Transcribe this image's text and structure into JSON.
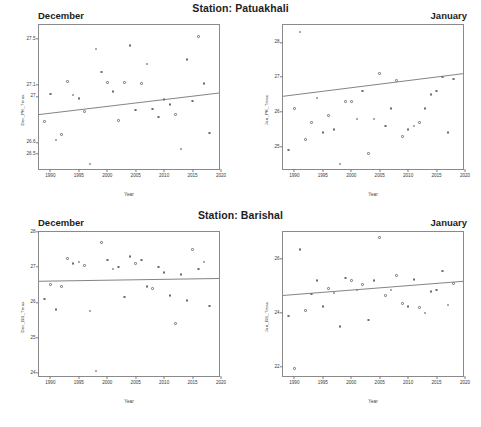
{
  "figure": {
    "width": 481,
    "height": 427,
    "point_color": "#6e6e78",
    "line_color": "#6b6b73",
    "frame_color": "#8a8a8a",
    "xlabel": "Year"
  },
  "stations": [
    {
      "title": "Station: Patuakhali",
      "panels": [
        {
          "panel_title": "December",
          "ylabel": "Dec_PK_Tmax",
          "yticks": [
            "26.5",
            "26.6",
            "27.0",
            "27.1",
            "27.5"
          ],
          "ytick_values": [
            26.5,
            26.6,
            27.0,
            27.1,
            27.5
          ],
          "xticks": [
            "1990",
            "1995",
            "2000",
            "2005",
            "2010",
            "2015",
            "2020"
          ]
        },
        {
          "panel_title": "January",
          "ylabel": "Jan_PK_Tmax",
          "yticks": [
            "25",
            "26",
            "27",
            "28"
          ],
          "ytick_values": [
            25,
            26,
            27,
            28
          ],
          "xticks": [
            "1990",
            "1995",
            "2000",
            "2005",
            "2010",
            "2015",
            "2020"
          ]
        }
      ]
    },
    {
      "title": "Station: Barishal",
      "panels": [
        {
          "panel_title": "December",
          "ylabel": "Dec_BS_Tmax",
          "yticks": [
            "24",
            "25",
            "26",
            "27",
            "28"
          ],
          "ytick_values": [
            24,
            25,
            26,
            27,
            28
          ],
          "xticks": [
            "1990",
            "1995",
            "2000",
            "2005",
            "2010",
            "2015",
            "2020"
          ]
        },
        {
          "panel_title": "January",
          "ylabel": "Jan_BS_Tmax",
          "yticks": [
            "22",
            "24",
            "26"
          ],
          "ytick_values": [
            22,
            24,
            26
          ],
          "xticks": [
            "1990",
            "1995",
            "2000",
            "2005",
            "2010",
            "2015",
            "2020"
          ]
        }
      ]
    }
  ],
  "chart_data": [
    {
      "type": "scatter",
      "title": "December",
      "panel_position": "top-left",
      "station": "Patuakhali",
      "month": "December",
      "xlabel": "Year",
      "ylabel": "Dec_PK_Tmax",
      "xlim": [
        1988,
        2020
      ],
      "ylim": [
        26.35,
        27.62
      ],
      "yticks": [
        26.5,
        26.6,
        27.0,
        27.1,
        27.5
      ],
      "xticks": [
        1990,
        1995,
        2000,
        2005,
        2010,
        2015,
        2020
      ],
      "grid": false,
      "legend": false,
      "points": [
        {
          "x": 1989,
          "y": 26.78
        },
        {
          "x": 1990,
          "y": 27.02
        },
        {
          "x": 1991,
          "y": 26.62
        },
        {
          "x": 1992,
          "y": 26.67
        },
        {
          "x": 1993,
          "y": 27.13
        },
        {
          "x": 1994,
          "y": 27.01
        },
        {
          "x": 1995,
          "y": 26.98
        },
        {
          "x": 1996,
          "y": 26.87
        },
        {
          "x": 1997,
          "y": 26.41
        },
        {
          "x": 1998,
          "y": 27.41
        },
        {
          "x": 1999,
          "y": 27.21
        },
        {
          "x": 2000,
          "y": 27.12
        },
        {
          "x": 2001,
          "y": 27.04
        },
        {
          "x": 2002,
          "y": 26.79
        },
        {
          "x": 2003,
          "y": 27.12
        },
        {
          "x": 2004,
          "y": 27.44
        },
        {
          "x": 2005,
          "y": 26.88
        },
        {
          "x": 2006,
          "y": 27.11
        },
        {
          "x": 2007,
          "y": 27.28
        },
        {
          "x": 2008,
          "y": 26.89
        },
        {
          "x": 2009,
          "y": 26.82
        },
        {
          "x": 2010,
          "y": 26.97
        },
        {
          "x": 2011,
          "y": 26.93
        },
        {
          "x": 2012,
          "y": 26.84
        },
        {
          "x": 2013,
          "y": 26.54
        },
        {
          "x": 2014,
          "y": 27.32
        },
        {
          "x": 2015,
          "y": 26.96
        },
        {
          "x": 2016,
          "y": 27.52
        },
        {
          "x": 2017,
          "y": 27.11
        },
        {
          "x": 2018,
          "y": 26.68
        }
      ],
      "trend_line": {
        "x": [
          1988,
          2020
        ],
        "y": [
          26.83,
          27.02
        ],
        "slope_per_year": 0.006
      }
    },
    {
      "type": "scatter",
      "title": "January",
      "panel_position": "top-right",
      "station": "Patuakhali",
      "month": "January",
      "xlabel": "Year",
      "ylabel": "Jan_PK_Tmax",
      "xlim": [
        1988,
        2020
      ],
      "ylim": [
        24.3,
        28.5
      ],
      "yticks": [
        25,
        26,
        27,
        28
      ],
      "xticks": [
        1990,
        1995,
        2000,
        2005,
        2010,
        2015,
        2020
      ],
      "grid": false,
      "legend": false,
      "points": [
        {
          "x": 1989,
          "y": 24.9
        },
        {
          "x": 1990,
          "y": 26.1
        },
        {
          "x": 1991,
          "y": 28.3
        },
        {
          "x": 1992,
          "y": 25.2
        },
        {
          "x": 1993,
          "y": 25.7
        },
        {
          "x": 1994,
          "y": 26.4
        },
        {
          "x": 1995,
          "y": 25.4
        },
        {
          "x": 1996,
          "y": 25.9
        },
        {
          "x": 1997,
          "y": 25.5
        },
        {
          "x": 1998,
          "y": 24.5
        },
        {
          "x": 1999,
          "y": 26.3
        },
        {
          "x": 2000,
          "y": 26.3
        },
        {
          "x": 2001,
          "y": 25.8
        },
        {
          "x": 2002,
          "y": 26.6
        },
        {
          "x": 2003,
          "y": 24.8
        },
        {
          "x": 2004,
          "y": 25.8
        },
        {
          "x": 2005,
          "y": 27.1
        },
        {
          "x": 2006,
          "y": 25.6
        },
        {
          "x": 2007,
          "y": 26.1
        },
        {
          "x": 2008,
          "y": 26.9
        },
        {
          "x": 2009,
          "y": 25.3
        },
        {
          "x": 2010,
          "y": 25.5
        },
        {
          "x": 2011,
          "y": 25.6
        },
        {
          "x": 2012,
          "y": 25.7
        },
        {
          "x": 2013,
          "y": 26.1
        },
        {
          "x": 2014,
          "y": 26.5
        },
        {
          "x": 2015,
          "y": 26.6
        },
        {
          "x": 2016,
          "y": 27.0
        },
        {
          "x": 2017,
          "y": 25.4
        },
        {
          "x": 2018,
          "y": 26.95
        }
      ],
      "trend_line": {
        "x": [
          1988,
          2020
        ],
        "y": [
          26.42,
          27.08
        ],
        "slope_per_year": 0.021
      }
    },
    {
      "type": "scatter",
      "title": "December",
      "panel_position": "bottom-left",
      "station": "Barishal",
      "month": "December",
      "xlabel": "Year",
      "ylabel": "Dec_BS_Tmax",
      "xlim": [
        1988,
        2020
      ],
      "ylim": [
        23.85,
        28.0
      ],
      "yticks": [
        24,
        25,
        26,
        27,
        28
      ],
      "xticks": [
        1990,
        1995,
        2000,
        2005,
        2010,
        2015,
        2020
      ],
      "grid": false,
      "legend": false,
      "points": [
        {
          "x": 1989,
          "y": 26.1
        },
        {
          "x": 1990,
          "y": 26.5
        },
        {
          "x": 1991,
          "y": 25.8
        },
        {
          "x": 1992,
          "y": 26.45
        },
        {
          "x": 1993,
          "y": 27.25
        },
        {
          "x": 1994,
          "y": 27.1
        },
        {
          "x": 1995,
          "y": 27.15
        },
        {
          "x": 1996,
          "y": 27.05
        },
        {
          "x": 1997,
          "y": 25.75
        },
        {
          "x": 1998,
          "y": 24.05
        },
        {
          "x": 1999,
          "y": 27.7
        },
        {
          "x": 2000,
          "y": 27.2
        },
        {
          "x": 2001,
          "y": 26.95
        },
        {
          "x": 2002,
          "y": 27.0
        },
        {
          "x": 2003,
          "y": 26.15
        },
        {
          "x": 2004,
          "y": 27.3
        },
        {
          "x": 2005,
          "y": 27.1
        },
        {
          "x": 2006,
          "y": 27.2
        },
        {
          "x": 2007,
          "y": 26.45
        },
        {
          "x": 2008,
          "y": 26.4
        },
        {
          "x": 2009,
          "y": 27.0
        },
        {
          "x": 2010,
          "y": 26.85
        },
        {
          "x": 2011,
          "y": 26.2
        },
        {
          "x": 2012,
          "y": 25.4
        },
        {
          "x": 2013,
          "y": 26.8
        },
        {
          "x": 2014,
          "y": 26.05
        },
        {
          "x": 2015,
          "y": 27.5
        },
        {
          "x": 2016,
          "y": 26.95
        },
        {
          "x": 2017,
          "y": 27.15
        },
        {
          "x": 2018,
          "y": 25.9
        }
      ],
      "trend_line": {
        "x": [
          1988,
          2020
        ],
        "y": [
          26.58,
          26.66
        ],
        "slope_per_year": 0.0025
      }
    },
    {
      "type": "scatter",
      "title": "January",
      "panel_position": "bottom-right",
      "station": "Barishal",
      "month": "January",
      "xlabel": "Year",
      "ylabel": "Jan_BS_Tmax",
      "xlim": [
        1988,
        2020
      ],
      "ylim": [
        21.6,
        27.0
      ],
      "yticks": [
        22,
        24,
        26
      ],
      "xticks": [
        1990,
        1995,
        2000,
        2005,
        2010,
        2015,
        2020
      ],
      "grid": false,
      "legend": false,
      "points": [
        {
          "x": 1989,
          "y": 23.9
        },
        {
          "x": 1990,
          "y": 21.95
        },
        {
          "x": 1991,
          "y": 26.35
        },
        {
          "x": 1992,
          "y": 24.1
        },
        {
          "x": 1993,
          "y": 24.7
        },
        {
          "x": 1994,
          "y": 25.2
        },
        {
          "x": 1995,
          "y": 24.25
        },
        {
          "x": 1996,
          "y": 24.9
        },
        {
          "x": 1997,
          "y": 24.75
        },
        {
          "x": 1998,
          "y": 23.5
        },
        {
          "x": 1999,
          "y": 25.3
        },
        {
          "x": 2000,
          "y": 25.2
        },
        {
          "x": 2001,
          "y": 24.85
        },
        {
          "x": 2002,
          "y": 25.05
        },
        {
          "x": 2003,
          "y": 23.75
        },
        {
          "x": 2004,
          "y": 25.2
        },
        {
          "x": 2005,
          "y": 26.8
        },
        {
          "x": 2006,
          "y": 24.65
        },
        {
          "x": 2007,
          "y": 24.85
        },
        {
          "x": 2008,
          "y": 25.4
        },
        {
          "x": 2009,
          "y": 24.35
        },
        {
          "x": 2010,
          "y": 24.25
        },
        {
          "x": 2011,
          "y": 25.25
        },
        {
          "x": 2012,
          "y": 24.2
        },
        {
          "x": 2013,
          "y": 24.0
        },
        {
          "x": 2014,
          "y": 24.8
        },
        {
          "x": 2015,
          "y": 24.85
        },
        {
          "x": 2016,
          "y": 25.55
        },
        {
          "x": 2017,
          "y": 24.3
        },
        {
          "x": 2018,
          "y": 25.1
        }
      ],
      "trend_line": {
        "x": [
          1988,
          2020
        ],
        "y": [
          24.62,
          25.15
        ],
        "slope_per_year": 0.017
      }
    }
  ]
}
